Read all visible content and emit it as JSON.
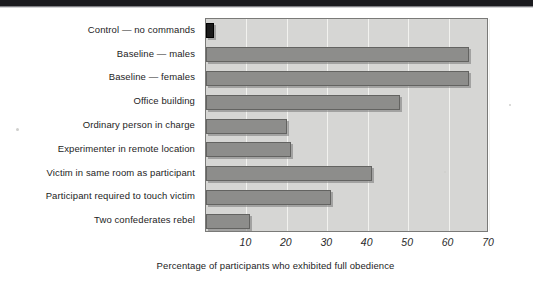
{
  "chart_data": {
    "type": "bar",
    "orientation": "horizontal",
    "title": "",
    "subtitle": "",
    "xlabel": "Percentage of participants who exhibited full obedience",
    "ylabel": "",
    "xlim": [
      0,
      70
    ],
    "ylim": null,
    "xticks": [
      10,
      20,
      30,
      40,
      50,
      60,
      70
    ],
    "xticklabels": [
      "10",
      "20",
      "30",
      "40",
      "50",
      "60",
      "70"
    ],
    "grid": true,
    "grid_axis": "x",
    "legend": false,
    "legend_position": "none",
    "categories": [
      "Control — no commands",
      "Baseline — males",
      "Baseline — females",
      "Office building",
      "Ordinary person in charge",
      "Experimenter in remote location",
      "Victim in same room as participant",
      "Participant required to touch victim",
      "Two confederates rebel"
    ],
    "values": [
      2,
      65,
      65,
      48,
      20,
      21,
      41,
      31,
      11
    ],
    "bar_colors": [
      "#1a1a1a",
      "#8d8d8b",
      "#8d8d8b",
      "#8d8d8b",
      "#8d8d8b",
      "#8d8d8b",
      "#8d8d8b",
      "#8d8d8b",
      "#8d8d8b"
    ]
  },
  "figure": {
    "plot_background": "#d6d6d4",
    "page_background": "#ffffff",
    "bar_fill": "#8d8d8b",
    "bar_edge": "#636361",
    "control_bar_fill": "#1a1a1a",
    "gridline_color": "#f2f2ef",
    "axis_color": "#7a7a78",
    "text_color": "#1d1d1d"
  },
  "axis_caption": {
    "text": "Percentage of participants who exhibited full obedience"
  }
}
